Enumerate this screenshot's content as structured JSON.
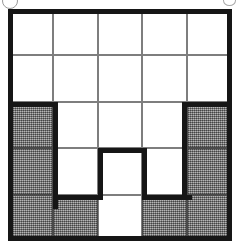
{
  "figure": {
    "name": "shaded-grid-puzzle",
    "type": "grid",
    "rows": 5,
    "columns": 5,
    "colors": {
      "shaded_fill": "#8c8c8c",
      "empty_fill": "#ffffff",
      "thin_gridline": "#7e7e7e",
      "thick_outline": "#161616",
      "page_background": "#ffffff"
    },
    "geometry": {
      "figure_left": 8,
      "figure_top": 9,
      "figure_width": 224,
      "figure_height": 232,
      "cell_width": 44.8,
      "cell_height": 46.4,
      "outer_border_width": 5,
      "thin_border_width": 1,
      "thick_segment_width": 5
    },
    "legend": {
      "shaded_meaning": "shaded",
      "empty_meaning": "empty"
    },
    "counts": {
      "shaded_cells": 10,
      "empty_cells": 15,
      "total_cells": 25
    },
    "cells": [
      [
        {
          "id": "r1c1",
          "state": "empty"
        },
        {
          "id": "r1c2",
          "state": "empty"
        },
        {
          "id": "r1c3",
          "state": "empty"
        },
        {
          "id": "r1c4",
          "state": "empty"
        },
        {
          "id": "r1c5",
          "state": "empty"
        }
      ],
      [
        {
          "id": "r2c1",
          "state": "empty"
        },
        {
          "id": "r2c2",
          "state": "empty"
        },
        {
          "id": "r2c3",
          "state": "empty"
        },
        {
          "id": "r2c4",
          "state": "empty"
        },
        {
          "id": "r2c5",
          "state": "empty"
        }
      ],
      [
        {
          "id": "r3c1",
          "state": "shaded"
        },
        {
          "id": "r3c2",
          "state": "empty"
        },
        {
          "id": "r3c3",
          "state": "empty"
        },
        {
          "id": "r3c4",
          "state": "empty"
        },
        {
          "id": "r3c5",
          "state": "shaded"
        }
      ],
      [
        {
          "id": "r4c1",
          "state": "shaded"
        },
        {
          "id": "r4c2",
          "state": "empty"
        },
        {
          "id": "r4c3",
          "state": "empty"
        },
        {
          "id": "r4c4",
          "state": "empty"
        },
        {
          "id": "r4c5",
          "state": "shaded"
        }
      ],
      [
        {
          "id": "r5c1",
          "state": "shaded"
        },
        {
          "id": "r5c2",
          "state": "shaded"
        },
        {
          "id": "r5c3",
          "state": "empty"
        },
        {
          "id": "r5c4",
          "state": "shaded"
        },
        {
          "id": "r5c5",
          "state": "shaded"
        }
      ]
    ],
    "thick_outline_segments": [
      {
        "id": "seg-top-c1-r3",
        "orientation": "horizontal",
        "x": 0,
        "y": 92.8,
        "length": 49.8,
        "thickness": 5
      },
      {
        "id": "seg-right-c1",
        "orientation": "vertical",
        "x": 44.8,
        "y": 92.8,
        "length": 106.8,
        "thickness": 5
      },
      {
        "id": "seg-bottom-c2-r5",
        "orientation": "horizontal",
        "x": 44.8,
        "y": 185.6,
        "length": 49.8,
        "thickness": 5
      },
      {
        "id": "seg-left-c3-r4",
        "orientation": "vertical",
        "x": 89.6,
        "y": 139.2,
        "length": 51.4,
        "thickness": 5
      },
      {
        "id": "seg-top-c3-r4",
        "orientation": "horizontal",
        "x": 89.6,
        "y": 139.2,
        "length": 49.8,
        "thickness": 5
      },
      {
        "id": "seg-right-c3-r4",
        "orientation": "vertical",
        "x": 134.4,
        "y": 139.2,
        "length": 51.4,
        "thickness": 5
      },
      {
        "id": "seg-bottom-c4-r5",
        "orientation": "horizontal",
        "x": 134.4,
        "y": 185.6,
        "length": 49.8,
        "thickness": 5
      },
      {
        "id": "seg-left-c5",
        "orientation": "vertical",
        "x": 174.4,
        "y": 92.8,
        "length": 97.0,
        "thickness": 5
      },
      {
        "id": "seg-top-c5-r3",
        "orientation": "horizontal",
        "x": 174.4,
        "y": 92.8,
        "length": 49.6,
        "thickness": 5
      }
    ]
  },
  "artifacts": [
    {
      "id": "artifact-top-left",
      "shape": "circle-arc"
    },
    {
      "id": "artifact-top-right",
      "shape": "smudge-arc"
    }
  ]
}
